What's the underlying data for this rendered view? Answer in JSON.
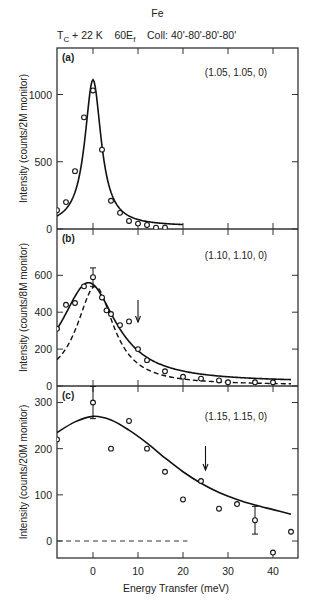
{
  "figure": {
    "title": "Fe",
    "subtitle_parts": {
      "T": "T",
      "c_sub": "C",
      "rest": " + 22 K    60E",
      "f_sub": "f",
      "coll": "    Coll: 40'-80'-80'-80'"
    },
    "xlabel": "Energy Transfer (meV)",
    "x_ticks": [
      0,
      10,
      20,
      30,
      40
    ]
  },
  "chart_data": [
    {
      "type": "scatter",
      "panel": "(a)",
      "annotation": "(1.05, 1.05, 0)",
      "title": "Fe, Tc + 22 K, 60Ef, Coll: 40'-80'-80'-80'",
      "xlabel": "Energy Transfer (meV)",
      "ylabel": "Intensity (counts/2M monitor)",
      "xlim": [
        -8,
        45.5
      ],
      "ylim": [
        0,
        1340
      ],
      "y_ticks": [
        0,
        500,
        1000
      ],
      "x_ticks": [
        0,
        10,
        20,
        30,
        40
      ],
      "grid": false,
      "series": [
        {
          "name": "data",
          "style": "open-circle",
          "x": [
            -8,
            -6,
            -4,
            -2,
            0,
            2,
            4,
            6,
            8,
            10,
            12,
            14,
            16
          ],
          "y": [
            140,
            200,
            430,
            830,
            1030,
            590,
            210,
            120,
            60,
            40,
            30,
            10,
            10
          ]
        },
        {
          "name": "fit",
          "style": "solid-line",
          "peak_x": 0,
          "peak_y": 1110,
          "hwhm": 2.2,
          "background": 20
        }
      ]
    },
    {
      "type": "scatter",
      "panel": "(b)",
      "annotation": "(1.10, 1.10, 0)",
      "ylabel": "Intensity (counts/8M monitor)",
      "xlim": [
        -8,
        45.5
      ],
      "ylim": [
        0,
        850
      ],
      "y_ticks": [
        0,
        200,
        400,
        600
      ],
      "x_ticks": [
        0,
        10,
        20,
        30,
        40
      ],
      "grid": false,
      "arrow_x": 10,
      "series": [
        {
          "name": "data",
          "style": "open-circle",
          "x": [
            -8,
            -6,
            -4,
            -2,
            0,
            2,
            3,
            4,
            6,
            8,
            10,
            12,
            16,
            20,
            24,
            28,
            30,
            36,
            40
          ],
          "y": [
            310,
            440,
            450,
            540,
            590,
            480,
            410,
            390,
            330,
            350,
            200,
            140,
            80,
            50,
            40,
            30,
            20,
            20,
            20
          ],
          "error_bar": {
            "x": 0,
            "y": 590,
            "err": 50
          }
        },
        {
          "name": "fit (solid)",
          "style": "solid-line",
          "peak_x": -1,
          "peak_y": 560,
          "hwhm": 7.5,
          "background": 20
        },
        {
          "name": "resolution (dashed)",
          "style": "dashed-line",
          "peak_x": 0.5,
          "peak_y": 540,
          "hwhm": 5.0,
          "background": 5
        }
      ]
    },
    {
      "type": "scatter",
      "panel": "(c)",
      "annotation": "(1.15, 1.15, 0)",
      "ylabel": "Intensity (counts/20M monitor)",
      "xlim": [
        -8,
        45.5
      ],
      "ylim": [
        -38,
        370
      ],
      "y_ticks": [
        0,
        100,
        200,
        300
      ],
      "x_ticks": [
        0,
        10,
        20,
        30,
        40
      ],
      "grid": false,
      "arrow_x": 25,
      "zero_line": {
        "style": "dashed",
        "x_range": [
          -8,
          21
        ]
      },
      "series": [
        {
          "name": "data",
          "style": "open-circle",
          "x": [
            -8,
            0,
            4,
            8,
            12,
            16,
            20,
            24,
            28,
            32,
            36,
            40,
            44
          ],
          "y": [
            220,
            300,
            200,
            260,
            200,
            150,
            90,
            130,
            70,
            80,
            45,
            -25,
            20
          ],
          "error_bars": [
            {
              "x": 0,
              "y": 300,
              "err": 35
            },
            {
              "x": 36,
              "y": 45,
              "err": 30
            }
          ]
        },
        {
          "name": "fit",
          "style": "solid-line",
          "x": [
            -8,
            -4,
            0,
            4,
            8,
            12,
            16,
            20,
            24,
            28,
            32,
            36,
            40,
            44
          ],
          "y": [
            235,
            258,
            270,
            262,
            240,
            212,
            180,
            150,
            125,
            105,
            90,
            78,
            68,
            58
          ]
        }
      ]
    }
  ]
}
